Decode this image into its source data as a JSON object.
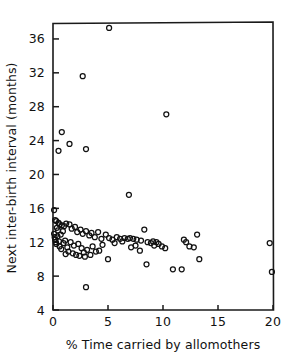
{
  "chart_data": {
    "type": "scatter",
    "title": "",
    "subtitle": "",
    "xlabel": "% Time carried by allomothers",
    "ylabel": "Next inter-birth interval (months)",
    "xlim": [
      0,
      20
    ],
    "ylim": [
      4,
      38
    ],
    "grid": false,
    "legend": null,
    "legend_position": "none",
    "marker": "open-circle",
    "marker_color": "#111111",
    "xticks": [
      0,
      5,
      10,
      15,
      20
    ],
    "xtick_labels": [
      "0",
      "5",
      "10",
      "15",
      "20"
    ],
    "yticks": [
      4,
      8,
      12,
      16,
      20,
      24,
      28,
      32,
      36
    ],
    "ytick_labels": [
      "4",
      "8",
      "12",
      "16",
      "20",
      "24",
      "28",
      "32",
      "36"
    ],
    "n_points": 97,
    "series": [
      {
        "name": "primate species",
        "points": [
          [
            5.1,
            37.3
          ],
          [
            2.7,
            31.6
          ],
          [
            10.3,
            27.1
          ],
          [
            0.8,
            25.0
          ],
          [
            1.5,
            23.6
          ],
          [
            3.0,
            23.0
          ],
          [
            0.5,
            22.8
          ],
          [
            6.9,
            17.6
          ],
          [
            0.1,
            15.8
          ],
          [
            0.2,
            14.6
          ],
          [
            0.3,
            14.5
          ],
          [
            0.5,
            14.3
          ],
          [
            0.6,
            14.1
          ],
          [
            0.8,
            14.0
          ],
          [
            1.0,
            13.9
          ],
          [
            1.2,
            14.2
          ],
          [
            1.5,
            14.1
          ],
          [
            1.7,
            13.6
          ],
          [
            2.0,
            13.8
          ],
          [
            2.2,
            13.2
          ],
          [
            2.5,
            13.5
          ],
          [
            2.7,
            13.0
          ],
          [
            3.0,
            13.3
          ],
          [
            3.3,
            12.8
          ],
          [
            3.5,
            13.1
          ],
          [
            3.8,
            12.6
          ],
          [
            4.1,
            13.2
          ],
          [
            4.4,
            12.4
          ],
          [
            4.8,
            12.9
          ],
          [
            5.1,
            12.5
          ],
          [
            5.4,
            12.3
          ],
          [
            5.8,
            12.6
          ],
          [
            6.1,
            12.4
          ],
          [
            6.5,
            12.5
          ],
          [
            6.8,
            12.4
          ],
          [
            7.0,
            12.5
          ],
          [
            7.3,
            12.4
          ],
          [
            7.6,
            12.3
          ],
          [
            8.0,
            12.2
          ],
          [
            8.3,
            13.5
          ],
          [
            8.6,
            12.0
          ],
          [
            8.9,
            11.9
          ],
          [
            9.1,
            12.1
          ],
          [
            9.4,
            12.0
          ],
          [
            9.6,
            11.8
          ],
          [
            9.9,
            11.5
          ],
          [
            10.2,
            11.3
          ],
          [
            11.9,
            12.3
          ],
          [
            12.1,
            12.0
          ],
          [
            12.4,
            11.5
          ],
          [
            13.1,
            12.9
          ],
          [
            13.3,
            10.0
          ],
          [
            19.7,
            11.9
          ],
          [
            19.9,
            8.5
          ],
          [
            0.1,
            13.0
          ],
          [
            0.15,
            12.6
          ],
          [
            0.2,
            12.3
          ],
          [
            0.25,
            12.0
          ],
          [
            0.3,
            11.8
          ],
          [
            0.4,
            12.7
          ],
          [
            0.45,
            13.4
          ],
          [
            0.55,
            12.1
          ],
          [
            0.6,
            11.5
          ],
          [
            0.7,
            12.9
          ],
          [
            0.75,
            11.2
          ],
          [
            0.9,
            13.3
          ],
          [
            0.95,
            11.9
          ],
          [
            1.1,
            12.2
          ],
          [
            1.15,
            10.6
          ],
          [
            1.3,
            11.4
          ],
          [
            1.4,
            10.9
          ],
          [
            1.6,
            12.0
          ],
          [
            1.8,
            10.7
          ],
          [
            1.9,
            11.6
          ],
          [
            2.1,
            10.5
          ],
          [
            2.3,
            11.8
          ],
          [
            2.4,
            10.4
          ],
          [
            2.6,
            11.3
          ],
          [
            2.8,
            10.8
          ],
          [
            2.9,
            10.3
          ],
          [
            3.1,
            11.1
          ],
          [
            3.4,
            10.5
          ],
          [
            3.6,
            11.5
          ],
          [
            3.9,
            10.9
          ],
          [
            4.2,
            11.0
          ],
          [
            4.5,
            11.7
          ],
          [
            5.0,
            10.0
          ],
          [
            5.6,
            11.9
          ],
          [
            6.3,
            12.1
          ],
          [
            7.1,
            11.4
          ],
          [
            7.5,
            11.6
          ],
          [
            7.9,
            11.0
          ],
          [
            8.5,
            9.4
          ],
          [
            9.2,
            11.6
          ],
          [
            10.9,
            8.8
          ],
          [
            11.7,
            8.8
          ],
          [
            12.8,
            11.4
          ],
          [
            3.0,
            6.7
          ],
          [
            0.35,
            13.7
          ]
        ]
      }
    ]
  },
  "figure": {
    "background_color": "#ffffff",
    "axis_color": "#111111"
  }
}
